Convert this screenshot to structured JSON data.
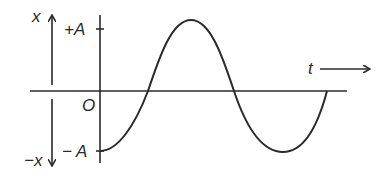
{
  "diagram": {
    "type": "displacement-time graph (SHM)",
    "labels": {
      "x_positive": "x",
      "x_negative": "−x",
      "plus_amplitude": "+A",
      "minus_amplitude": "− A",
      "origin": "O",
      "time": "t"
    },
    "curve": {
      "description": "Displacement starts at −A at t=0, rises through zero to +A, falls through zero to −A, rises back to zero",
      "points": [
        {
          "x": 100,
          "y": 151,
          "label": "−A at t=0"
        },
        {
          "x": 148,
          "y": 91,
          "label": "zero crossing"
        },
        {
          "x": 191,
          "y": 20,
          "label": "+A peak"
        },
        {
          "x": 234,
          "y": 91,
          "label": "zero crossing"
        },
        {
          "x": 283,
          "y": 152,
          "label": "−A trough"
        },
        {
          "x": 327,
          "y": 91,
          "label": "zero"
        }
      ]
    },
    "colors": {
      "stroke": "#2a2a2a",
      "background": "#ffffff"
    }
  }
}
